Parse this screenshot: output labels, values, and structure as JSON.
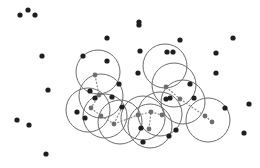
{
  "diagram": {
    "type": "density-clustering-illustration",
    "background": "#ffffff",
    "colors": {
      "point": "#1f1f1f",
      "core_point": "#6e6e6e",
      "circle": "#6a6a6a",
      "edge": "#8a8a8a"
    },
    "point_radius": 2.6,
    "core_radius": 2.4,
    "circle_radius": 22,
    "points": [
      [
        20,
        15
      ],
      [
        28,
        10
      ],
      [
        35,
        15
      ],
      [
        107,
        38
      ],
      [
        42,
        56
      ],
      [
        83,
        56
      ],
      [
        107,
        61
      ],
      [
        139,
        22
      ],
      [
        139,
        25
      ],
      [
        180,
        40
      ],
      [
        233,
        38
      ],
      [
        140,
        51
      ],
      [
        167,
        52
      ],
      [
        173,
        52
      ],
      [
        216,
        53
      ],
      [
        138,
        73
      ],
      [
        216,
        73
      ],
      [
        48,
        90
      ],
      [
        90,
        91
      ],
      [
        119,
        84
      ],
      [
        95,
        98
      ],
      [
        77,
        112
      ],
      [
        85,
        118
      ],
      [
        112,
        97
      ],
      [
        166,
        99
      ],
      [
        170,
        98
      ],
      [
        225,
        108
      ],
      [
        249,
        104
      ],
      [
        17,
        120
      ],
      [
        29,
        125
      ],
      [
        141,
        128
      ],
      [
        244,
        133
      ],
      [
        169,
        136
      ],
      [
        176,
        130
      ],
      [
        46,
        154
      ],
      [
        143,
        142
      ],
      [
        122,
        107
      ],
      [
        190,
        84
      ],
      [
        194,
        98
      ]
    ],
    "core_points": [
      [
        95,
        75
      ],
      [
        99,
        95
      ],
      [
        91,
        108
      ],
      [
        101,
        116
      ],
      [
        114,
        124
      ],
      [
        138,
        115
      ],
      [
        151,
        112
      ],
      [
        162,
        115
      ],
      [
        166,
        87
      ],
      [
        180,
        99
      ],
      [
        205,
        116
      ],
      [
        212,
        122
      ],
      [
        149,
        129
      ]
    ],
    "circles": [
      [
        98,
        72
      ],
      [
        101,
        96
      ],
      [
        88,
        110
      ],
      [
        105,
        116
      ],
      [
        120,
        122
      ],
      [
        143,
        118
      ],
      [
        160,
        114
      ],
      [
        165,
        66
      ],
      [
        174,
        85
      ],
      [
        183,
        102
      ],
      [
        208,
        120
      ],
      [
        150,
        126
      ]
    ],
    "edges": [
      [
        [
          95,
          75
        ],
        [
          99,
          95
        ]
      ],
      [
        [
          99,
          95
        ],
        [
          91,
          108
        ]
      ],
      [
        [
          91,
          108
        ],
        [
          101,
          116
        ]
      ],
      [
        [
          101,
          116
        ],
        [
          114,
          124
        ]
      ],
      [
        [
          114,
          124
        ],
        [
          122,
          107
        ]
      ],
      [
        [
          138,
          115
        ],
        [
          151,
          112
        ]
      ],
      [
        [
          151,
          112
        ],
        [
          162,
          115
        ]
      ],
      [
        [
          166,
          87
        ],
        [
          180,
          99
        ]
      ],
      [
        [
          180,
          99
        ],
        [
          205,
          116
        ]
      ],
      [
        [
          205,
          116
        ],
        [
          212,
          122
        ]
      ],
      [
        [
          114,
          124
        ],
        [
          138,
          115
        ]
      ],
      [
        [
          149,
          129
        ],
        [
          151,
          112
        ]
      ]
    ]
  }
}
